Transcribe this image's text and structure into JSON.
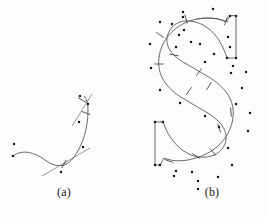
{
  "figure": {
    "background_color": "#fcfcfc",
    "curve_color": "#555a5e",
    "control_point_color": "#16181a",
    "node_marker_color": "#3a3d40",
    "handle_line_color": "#6a6f74"
  },
  "panels": [
    {
      "id": "a",
      "label": "(a)",
      "caption_position": "bottom-center",
      "description": "single open cubic spline with control points and node ticks"
    },
    {
      "id": "b",
      "label": "(b)",
      "caption_position": "bottom-center",
      "description": "letter S outline built from cubic spline segments with control points and node ticks"
    }
  ],
  "chart_data": {
    "type": "scatter",
    "xlabel": "",
    "ylabel": "",
    "xlim": [
      0,
      267
    ],
    "ylim": [
      0,
      218
    ],
    "grid": false,
    "legend": null,
    "panel_a": {
      "curves": [
        "M 13 156 C 22 149 34 152 45 160 C 56 168 66 168 74 157 C 83 145 88 127 88 111 C 88 104 87 99 84 96"
      ],
      "control_points": [
        [
          13,
          156
        ],
        [
          14,
          144
        ],
        [
          61,
          172
        ],
        [
          83,
          147
        ],
        [
          79,
          122
        ],
        [
          88,
          104
        ],
        [
          80,
          96
        ]
      ],
      "node_ticks": [
        {
          "x": 64,
          "y": 164,
          "angle": 118
        },
        {
          "x": 86,
          "y": 113,
          "angle": 20
        },
        {
          "x": 82,
          "y": 100,
          "angle": 30
        }
      ],
      "handle_lines": [
        [
          [
            42,
            176
          ],
          [
            90,
            148
          ]
        ],
        [
          [
            72,
            126
          ],
          [
            92,
            94
          ]
        ]
      ]
    },
    "panel_b": {
      "curves": [
        "M 236 16 L 236 58 L 227 58 C 222 42 214 31 203 25 C 190 18 176 20 170 30 C 163 41 168 53 183 62 L 207 76 C 226 87 235 101 233 117 C 231 138 214 154 192 159 C 181 162 171 161 164 158 L 160 165 L 155 165 L 155 122 L 163 122 C 169 139 179 150 191 155 C 205 160 219 156 224 146 C 230 134 223 122 206 112 L 184 99 C 165 88 157 74 159 58 C 161 38 177 23 197 19 C 208 17 218 18 226 22 L 230 16 Z",
        "M 228 22 C 219 18 208 17 197 19"
      ],
      "control_points": [
        [
          230,
          16
        ],
        [
          236,
          16
        ],
        [
          236,
          58
        ],
        [
          227,
          58
        ],
        [
          213,
          9
        ],
        [
          183,
          12
        ],
        [
          160,
          22
        ],
        [
          150,
          44
        ],
        [
          151,
          68
        ],
        [
          160,
          90
        ],
        [
          180,
          103
        ],
        [
          205,
          116
        ],
        [
          219,
          127
        ],
        [
          228,
          148
        ],
        [
          232,
          165
        ],
        [
          218,
          177
        ],
        [
          198,
          181
        ],
        [
          198,
          189
        ],
        [
          174,
          176
        ],
        [
          160,
          165
        ],
        [
          155,
          165
        ],
        [
          155,
          122
        ],
        [
          163,
          122
        ],
        [
          176,
          171
        ],
        [
          192,
          172
        ],
        [
          236,
          104
        ],
        [
          242,
          88
        ],
        [
          233,
          66
        ],
        [
          214,
          54
        ],
        [
          191,
          42
        ],
        [
          179,
          35
        ],
        [
          172,
          24
        ],
        [
          183,
          17
        ],
        [
          200,
          44
        ],
        [
          205,
          62
        ],
        [
          176,
          47
        ],
        [
          184,
          30
        ],
        [
          231,
          73
        ],
        [
          246,
          72
        ],
        [
          250,
          113
        ],
        [
          248,
          131
        ],
        [
          228,
          37
        ],
        [
          230,
          47
        ]
      ],
      "node_ticks": [
        {
          "x": 186,
          "y": 19,
          "angle": 75
        },
        {
          "x": 160,
          "y": 35,
          "angle": 35
        },
        {
          "x": 159,
          "y": 64,
          "angle": 0
        },
        {
          "x": 174,
          "y": 55,
          "angle": 10
        },
        {
          "x": 199,
          "y": 72,
          "angle": 125
        },
        {
          "x": 189,
          "y": 91,
          "angle": 125
        },
        {
          "x": 209,
          "y": 86,
          "angle": 122
        },
        {
          "x": 231,
          "y": 112,
          "angle": 85
        },
        {
          "x": 219,
          "y": 128,
          "angle": 70
        },
        {
          "x": 196,
          "y": 156,
          "angle": 35
        },
        {
          "x": 213,
          "y": 152,
          "angle": 50
        },
        {
          "x": 169,
          "y": 161,
          "angle": 20
        },
        {
          "x": 226,
          "y": 21,
          "angle": 110
        }
      ],
      "handle_lines": []
    }
  }
}
